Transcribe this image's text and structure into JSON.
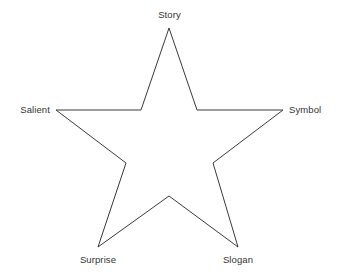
{
  "diagram": {
    "type": "five-point-star",
    "shape_name": "star-outline",
    "background_color": "#ffffff",
    "stroke_color": "#3a3a3a",
    "stroke_width": 1,
    "text_color": "#333333",
    "points": [
      {
        "id": "story",
        "label": "Story",
        "position": "top",
        "x": 169,
        "y": 28
      },
      {
        "id": "symbol",
        "label": "Symbol",
        "position": "right",
        "x": 283,
        "y": 110
      },
      {
        "id": "slogan",
        "label": "Slogan",
        "position": "bottom-right",
        "x": 238,
        "y": 247
      },
      {
        "id": "surprise",
        "label": "Surprise",
        "position": "bottom-left",
        "x": 98,
        "y": 247
      },
      {
        "id": "salient",
        "label": "Salient",
        "position": "left",
        "x": 56,
        "y": 110
      }
    ],
    "polygon_points": "169,28 197,110 283,110 213,163 238,247 169,196 98,247 126,163 56,110 141,110"
  }
}
